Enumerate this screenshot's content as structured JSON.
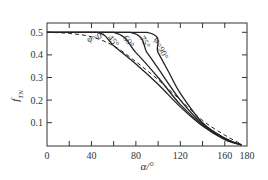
{
  "chart_data": {
    "type": "line",
    "title": "",
    "xlabel": "α/°",
    "ylabel": "f_TN",
    "xlim": [
      0,
      180
    ],
    "ylim": [
      0,
      0.54
    ],
    "xticks": [
      0,
      40,
      80,
      120,
      160,
      180
    ],
    "xticks_minor": [
      20,
      60,
      100,
      140
    ],
    "yticks": [
      0.1,
      0.2,
      0.3,
      0.4,
      0.5
    ],
    "grid": false,
    "legend": "inline labels",
    "series": [
      {
        "name": "φ=0°",
        "style": "dashed",
        "x": [
          0,
          20,
          40,
          60,
          80,
          100,
          120,
          140,
          160,
          175
        ],
        "y": [
          0.5,
          0.495,
          0.48,
          0.44,
          0.37,
          0.29,
          0.2,
          0.11,
          0.045,
          0.005
        ]
      },
      {
        "name": "45°",
        "style": "solid",
        "x": [
          0,
          45,
          60,
          80,
          100,
          120,
          140,
          160,
          175
        ],
        "y": [
          0.5,
          0.5,
          0.44,
          0.36,
          0.27,
          0.17,
          0.085,
          0.025,
          0.002
        ]
      },
      {
        "name": "60°",
        "style": "solid",
        "x": [
          0,
          60,
          80,
          100,
          120,
          140,
          160,
          175
        ],
        "y": [
          0.5,
          0.5,
          0.41,
          0.3,
          0.18,
          0.09,
          0.028,
          0.002
        ]
      },
      {
        "name": "75°",
        "style": "solid",
        "x": [
          0,
          75,
          90,
          100,
          120,
          140,
          160,
          175
        ],
        "y": [
          0.5,
          0.5,
          0.41,
          0.34,
          0.2,
          0.095,
          0.03,
          0.002
        ]
      },
      {
        "name": "φ=90°",
        "style": "solid",
        "x": [
          0,
          90,
          100,
          110,
          120,
          140,
          160,
          175
        ],
        "y": [
          0.5,
          0.5,
          0.41,
          0.32,
          0.23,
          0.1,
          0.032,
          0.002
        ]
      }
    ],
    "labels": [
      {
        "text": "φ=0°",
        "x": 37,
        "y": 0.455,
        "rotate": -18
      },
      {
        "text": "45°",
        "x": 54,
        "y": 0.475,
        "rotate": 50
      },
      {
        "text": "60°",
        "x": 68,
        "y": 0.475,
        "rotate": 55
      },
      {
        "text": "75°",
        "x": 83,
        "y": 0.475,
        "rotate": 60
      },
      {
        "text": "φ=90°",
        "x": 96,
        "y": 0.47,
        "rotate": 65
      }
    ]
  }
}
